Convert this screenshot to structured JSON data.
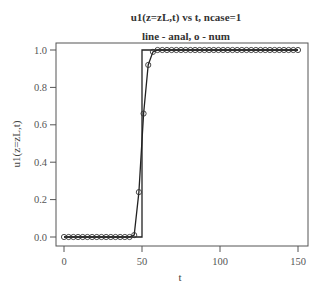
{
  "chart_data": {
    "type": "line",
    "title": "u1(z=zL,t) vs t, ncase=1",
    "subtitle": "line - anal, o - num",
    "xlabel": "t",
    "ylabel": "u1(z=zL,t)",
    "xlim": [
      0,
      150
    ],
    "ylim": [
      0.0,
      1.0
    ],
    "xticks": [
      0,
      50,
      100,
      150
    ],
    "yticks": [
      0.0,
      0.2,
      0.4,
      0.6,
      0.8,
      1.0
    ],
    "xtick_labels": [
      "0",
      "50",
      "100",
      "150"
    ],
    "ytick_labels": [
      "0.0",
      "0.2",
      "0.4",
      "0.6",
      "0.8",
      "1.0"
    ],
    "grid": false,
    "legend": "none (described in subtitle)",
    "series": [
      {
        "name": "anal",
        "style": "line",
        "description": "unit step at t=50",
        "x": [
          0,
          50,
          50,
          150
        ],
        "y": [
          0,
          0,
          1,
          1
        ]
      },
      {
        "name": "num",
        "style": "line+circles",
        "x": [
          0,
          3,
          6,
          9,
          12,
          15,
          18,
          21,
          24,
          27,
          30,
          33,
          36,
          39,
          42,
          45,
          48,
          51,
          54,
          57,
          60,
          63,
          66,
          69,
          72,
          75,
          78,
          81,
          84,
          87,
          90,
          93,
          96,
          99,
          102,
          105,
          108,
          111,
          114,
          117,
          120,
          123,
          126,
          129,
          132,
          135,
          138,
          141,
          144,
          147,
          150
        ],
        "y": [
          0,
          0,
          0,
          0,
          0,
          0,
          0,
          0,
          0,
          0,
          0,
          0,
          0,
          0,
          0,
          0.01,
          0.24,
          0.66,
          0.92,
          0.99,
          1,
          1,
          1,
          1,
          1,
          1,
          1,
          1,
          1,
          1,
          1,
          1,
          1,
          1,
          1,
          1,
          1,
          1,
          1,
          1,
          1,
          1,
          1,
          1,
          1,
          1,
          1,
          1,
          1,
          1,
          1
        ]
      }
    ]
  }
}
